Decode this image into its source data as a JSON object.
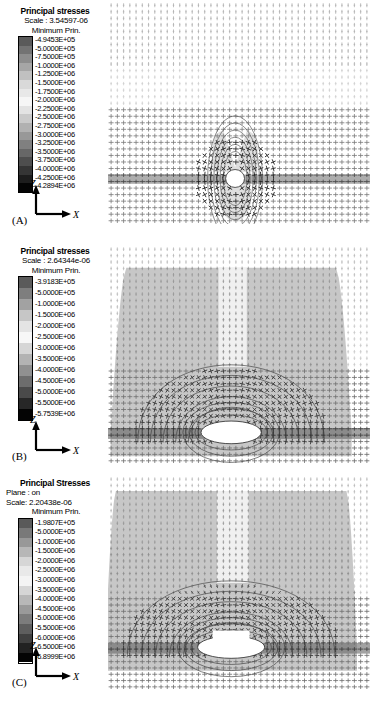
{
  "figure": {
    "width": 372,
    "height": 711,
    "background": "#ffffff",
    "ink": "#000000"
  },
  "panels": [
    {
      "id": "A",
      "letter": "(A)",
      "legend": {
        "title": "Principal stresses",
        "plane": null,
        "scale": "Scale : 3.54597-06",
        "component": "Minimum Prin.",
        "values": [
          "-4.9453E+05",
          "-5.0000E+05",
          "-7.5000E+05",
          "-1.0000E+06",
          "-1.2500E+06",
          "-1.5000E+06",
          "-1.7500E+06",
          "-2.0000E+06",
          "-2.2500E+06",
          "-2.5000E+06",
          "-2.7500E+06",
          "-3.0000E+06",
          "-3.2500E+06",
          "-3.5000E+06",
          "-3.7500E+06",
          "-4.0000E+06",
          "-4.2500E+06",
          "-4.2894E+06"
        ]
      },
      "axes": {
        "vertical": "Z",
        "horizontal": "X"
      }
    },
    {
      "id": "B",
      "letter": "(B)",
      "legend": {
        "title": "Principal stresses",
        "plane": null,
        "scale": "Scale : 2.64344e-06",
        "component": "Minimum Prin.",
        "values": [
          "-3.9183E+05",
          "-5.0000E+05",
          "-1.0000E+06",
          "-1.5000E+06",
          "-2.0000E+06",
          "-2.5000E+06",
          "-3.0000E+06",
          "-3.5000E+06",
          "-4.0000E+06",
          "-4.5000E+06",
          "-5.0000E+06",
          "-5.5000E+06",
          "-5.7539E+06"
        ]
      },
      "axes": {
        "vertical": "Z",
        "horizontal": "X"
      }
    },
    {
      "id": "C",
      "letter": "(C)",
      "legend": {
        "title": "Principal Stresses",
        "plane": "Plane :  on",
        "scale": "Scale: 2.20438e-06",
        "component": "Minimum Prin.",
        "values": [
          "-1.9807E+05",
          "-5.0000E+05",
          "-1.0000E+06",
          "-1.5000E+06",
          "-2.0000E+06",
          "-2.5000E+06",
          "-3.0000E+06",
          "-3.5000E+06",
          "-4.0000E+06",
          "-4.5000E+06",
          "-5.0000E+06",
          "-5.5000E+06",
          "-6.0000E+06",
          "-6.5000E+06",
          "-6.8999E+06"
        ]
      },
      "axes": {
        "vertical": "Z",
        "horizontal": "X"
      }
    }
  ],
  "chart_data": {
    "type": "scatter",
    "xlabel": "X",
    "ylabel": "Z",
    "grid": false,
    "legend_position": "top-left",
    "colormap": "grayscale",
    "glyph": "cross",
    "panels": [
      {
        "id": "A",
        "label": "(A)",
        "scale_factor": 3.54597e-06,
        "component": "Minimum Prin.",
        "value_min": -4289400,
        "value_max": -494530,
        "contour_levels": [
          -494530,
          -500000,
          -750000,
          -1000000,
          -1250000,
          -1500000,
          -1750000,
          -2000000,
          -2250000,
          -2500000,
          -2750000,
          -3000000,
          -3250000,
          -3500000,
          -3750000,
          -4000000,
          -4250000,
          -4289400
        ],
        "glyph_grid_cols": 42,
        "glyph_grid_rows": 34,
        "cavity": {
          "shape": "circle",
          "cx_frac": 0.48,
          "cy_frac": 0.8,
          "rx_frac": 0.035,
          "ry_frac": 0.045
        },
        "dark_band": {
          "y_frac": 0.795,
          "height_frac": 0.045
        },
        "stressed_region": {
          "shape": "narrow-lobes",
          "width_frac": 0.17,
          "top_frac": 0.56
        }
      },
      {
        "id": "B",
        "label": "(B)",
        "scale_factor": 2.64344e-06,
        "component": "Minimum Prin.",
        "value_min": -5753900,
        "value_max": -391830,
        "contour_levels": [
          -391830,
          -500000,
          -1000000,
          -1500000,
          -2000000,
          -2500000,
          -3000000,
          -3500000,
          -4000000,
          -4500000,
          -5000000,
          -5500000,
          -5753900
        ],
        "glyph_grid_cols": 42,
        "glyph_grid_rows": 34,
        "cavity": {
          "shape": "ellipse-flat",
          "cx_frac": 0.47,
          "cy_frac": 0.855,
          "rx_frac": 0.115,
          "ry_frac": 0.05
        },
        "dark_band": {
          "y_frac": 0.855,
          "height_frac": 0.05
        },
        "stressed_region": {
          "shape": "wide-fan",
          "width_frac": 0.86,
          "top_frac": 0.1
        }
      },
      {
        "id": "C",
        "label": "(C)",
        "scale_factor": 2.20438e-06,
        "component": "Minimum Prin.",
        "plane": "on",
        "value_min": -6899900,
        "value_max": -198070,
        "contour_levels": [
          -198070,
          -500000,
          -1000000,
          -1500000,
          -2000000,
          -2500000,
          -3000000,
          -3500000,
          -4000000,
          -4500000,
          -5000000,
          -5500000,
          -6000000,
          -6500000,
          -6899900
        ],
        "glyph_grid_cols": 42,
        "glyph_grid_rows": 34,
        "cavity": {
          "shape": "ellipse-flat",
          "cx_frac": 0.47,
          "cy_frac": 0.8,
          "rx_frac": 0.125,
          "ry_frac": 0.05
        },
        "dark_band": {
          "y_frac": 0.8,
          "height_frac": 0.05
        },
        "stressed_region": {
          "shape": "wide-fan",
          "width_frac": 0.92,
          "top_frac": 0.07
        }
      }
    ]
  }
}
